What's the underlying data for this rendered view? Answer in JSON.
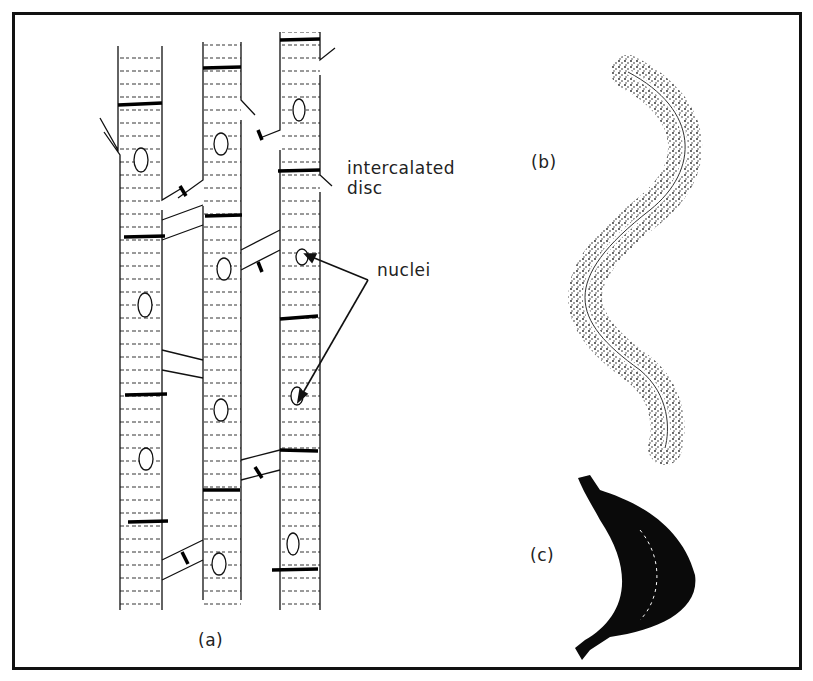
{
  "figure": {
    "panels": [
      {
        "id": "a",
        "label": "(a)",
        "subject": "cardiac muscle fibres"
      },
      {
        "id": "b",
        "label": "(b)",
        "subject": "smooth muscle cell"
      },
      {
        "id": "c",
        "label": "(c)",
        "subject": "contracted cell"
      }
    ],
    "annotations": {
      "intercalated_line1": "intercalated",
      "intercalated_line2": "disc",
      "nuclei": "nuclei"
    },
    "colors": {
      "ink": "#111111",
      "background": "#ffffff"
    }
  }
}
